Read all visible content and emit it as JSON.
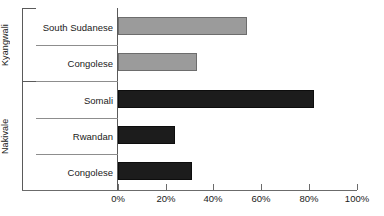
{
  "chart_data": {
    "type": "bar",
    "orientation": "horizontal",
    "title": "",
    "xlabel": "",
    "ylabel": "",
    "xlim": [
      0,
      100
    ],
    "grid": false,
    "legend": "none",
    "tick_labels": [
      "0%",
      "20%",
      "40%",
      "60%",
      "80%",
      "100%"
    ],
    "tick_values": [
      0,
      20,
      40,
      60,
      80,
      100
    ],
    "groups": [
      {
        "name": "Kyangwali",
        "color": "#9b9b9b",
        "categories": [
          "South Sudanese",
          "Congolese"
        ],
        "values": [
          54,
          33
        ]
      },
      {
        "name": "Nakivale",
        "color": "#1c1c1c",
        "categories": [
          "Somali",
          "Rwandan",
          "Congolese"
        ],
        "values": [
          82,
          24,
          31
        ]
      }
    ],
    "categories": [
      "South Sudanese",
      "Congolese",
      "Somali",
      "Rwandan",
      "Congolese"
    ],
    "values": [
      54,
      33,
      82,
      24,
      31
    ],
    "series": [
      {
        "name": "Kyangwali",
        "values": [
          54,
          33,
          null,
          null,
          null
        ]
      },
      {
        "name": "Nakivale",
        "values": [
          null,
          null,
          82,
          24,
          31
        ]
      }
    ]
  },
  "colors": {
    "light_bar": "#9b9b9b",
    "dark_bar": "#1c1c1c",
    "axis": "#5a5a5a",
    "separator": "#8d8d8d",
    "background": "#ffffff"
  },
  "bars": [
    {
      "label": "South Sudanese",
      "value": 54,
      "group": "Kyangwali",
      "style": "light"
    },
    {
      "label": "Congolese",
      "value": 33,
      "group": "Kyangwali",
      "style": "light"
    },
    {
      "label": "Somali",
      "value": 82,
      "group": "Nakivale",
      "style": "dark"
    },
    {
      "label": "Rwandan",
      "value": 24,
      "group": "Nakivale",
      "style": "dark"
    },
    {
      "label": "Congolese",
      "value": 31,
      "group": "Nakivale",
      "style": "dark"
    }
  ],
  "axis": {
    "ticks": [
      {
        "label": "0%",
        "value": 0
      },
      {
        "label": "20%",
        "value": 20
      },
      {
        "label": "40%",
        "value": 40
      },
      {
        "label": "60%",
        "value": 60
      },
      {
        "label": "80%",
        "value": 80
      },
      {
        "label": "100%",
        "value": 100
      }
    ]
  },
  "groups": [
    {
      "label": "Kyangwali"
    },
    {
      "label": "Nakivale"
    }
  ]
}
